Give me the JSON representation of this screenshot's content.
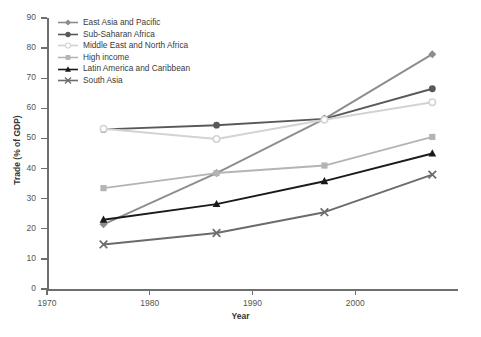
{
  "chart_data": {
    "type": "line",
    "title": "",
    "xlabel": "Year",
    "ylabel": "Trade (% of GDP)",
    "xlim": [
      1970,
      2010
    ],
    "ylim": [
      0,
      90
    ],
    "xticks": [
      1970,
      1980,
      1990,
      2000
    ],
    "yticks": [
      0,
      10,
      20,
      30,
      40,
      50,
      60,
      70,
      80,
      90
    ],
    "grid": false,
    "legend_position": "upper-left-inside",
    "x": [
      1975.5,
      1986.5,
      1997,
      2007.5
    ],
    "series": [
      {
        "name": "East Asia and Pacific",
        "values": [
          21.5,
          38.5,
          56.5,
          78.0
        ],
        "color": "#8d8d8d",
        "marker": "diamond"
      },
      {
        "name": "Sub-Saharan Africa",
        "values": [
          53.0,
          54.4,
          56.5,
          66.5
        ],
        "color": "#595959",
        "marker": "circle-filled"
      },
      {
        "name": "Middle East and North Africa",
        "values": [
          53.2,
          49.8,
          56.2,
          62.0
        ],
        "color": "#d3d3d3",
        "marker": "circle-open"
      },
      {
        "name": "High income",
        "values": [
          33.5,
          38.5,
          41.0,
          50.5
        ],
        "color": "#b4b4b4",
        "marker": "square"
      },
      {
        "name": "Latin America and Caribbean",
        "values": [
          23.0,
          28.2,
          35.8,
          45.0
        ],
        "color": "#1a1a1a",
        "marker": "triangle"
      },
      {
        "name": "South Asia",
        "values": [
          14.8,
          18.6,
          25.5,
          38.0
        ],
        "color": "#6b6b6b",
        "marker": "x"
      }
    ]
  },
  "axes": {
    "y_labels": [
      "90",
      "80",
      "70",
      "60",
      "50",
      "40",
      "30",
      "20",
      "10",
      "0"
    ],
    "x_labels": [
      "1970",
      "1980",
      "1990",
      "2000"
    ],
    "y_title": "Trade (% of GDP)",
    "x_title": "Year"
  },
  "legend": {
    "items": [
      {
        "label": "East Asia and Pacific"
      },
      {
        "label": "Sub-Saharan Africa"
      },
      {
        "label": "Middle East and North Africa"
      },
      {
        "label": "High income"
      },
      {
        "label": "Latin America and Caribbean"
      },
      {
        "label": "South Asia"
      }
    ]
  }
}
